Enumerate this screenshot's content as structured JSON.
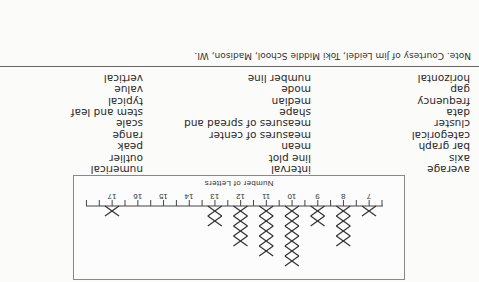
{
  "chart_data": {
    "type": "line plot (dot/X plot)",
    "title": "",
    "xlabel": "Number of Letters",
    "ylabel": "",
    "x_ticks": [
      7,
      8,
      9,
      10,
      11,
      12,
      13,
      14,
      15,
      16,
      17
    ],
    "xlim": [
      6.5,
      17.5
    ],
    "marker": "X",
    "points": [
      {
        "x": 7,
        "count": 1
      },
      {
        "x": 8,
        "count": 4
      },
      {
        "x": 9,
        "count": 2
      },
      {
        "x": 10,
        "count": 6
      },
      {
        "x": 11,
        "count": 5
      },
      {
        "x": 12,
        "count": 4
      },
      {
        "x": 13,
        "count": 2
      },
      {
        "x": 14,
        "count": 0
      },
      {
        "x": 15,
        "count": 0
      },
      {
        "x": 16,
        "count": 0
      },
      {
        "x": 17,
        "count": 1
      }
    ]
  },
  "word_columns": [
    [
      "average",
      "axis",
      "bar graph",
      "categorical",
      "cluster",
      "data",
      "frequency",
      "gap",
      "horizontal"
    ],
    [
      "interval",
      "line plot",
      "mean",
      "measures of center",
      "measures of spread and",
      "shape",
      "median",
      "mode",
      "number line"
    ],
    [
      "numerical",
      "outlier",
      "peak",
      "range",
      "scale",
      "stem and leaf",
      "typical",
      "value",
      "vertical"
    ]
  ],
  "note": "Note. Courtesy of Jim Leidel, Toki Middle School, Madison, WI.",
  "orientation": "rotated 180 degrees"
}
